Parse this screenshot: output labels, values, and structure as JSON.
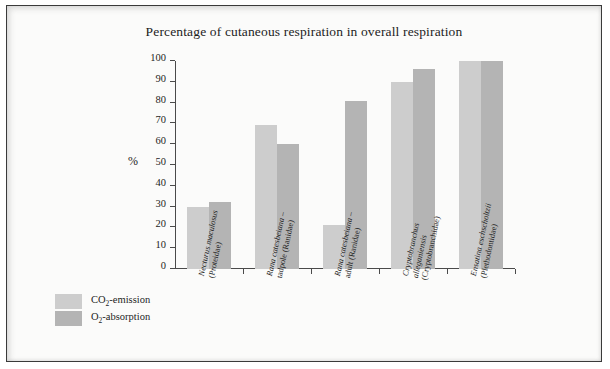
{
  "chart_data": {
    "type": "bar",
    "title": "Percentage of cutaneous respiration in overall respiration",
    "xlabel": "",
    "ylabel": "%",
    "ylim": [
      0,
      100
    ],
    "yticks": [
      0,
      10,
      20,
      30,
      40,
      50,
      60,
      70,
      80,
      90,
      100
    ],
    "grid": false,
    "legend_position": "bottom-left",
    "categories": [
      "Necturus maculosus (Proteidae)",
      "Rana catesbeiana – tadpole (Ranidae)",
      "Rana catesbeiana – adult (Ranidae)",
      "Cryptobranchus alleganiensis (Cryptobranchidae)",
      "Ensatina eschscholtzii (Plethodontidae)"
    ],
    "category_lines": [
      [
        {
          "text": "Necturus maculosus",
          "italic": true
        },
        {
          "text": "(Proteidae)",
          "italic": false
        }
      ],
      [
        {
          "text": "Rana catesbeiana",
          "italic": true,
          "suffix": " –"
        },
        {
          "text": "tadpole (Ranidae)",
          "italic": false
        }
      ],
      [
        {
          "text": "Rana catesbeiana",
          "italic": true,
          "suffix": " –"
        },
        {
          "text": "adult (Ranidae)",
          "italic": false
        }
      ],
      [
        {
          "text": "Cryptobranchus",
          "italic": true
        },
        {
          "text": "alleganiensis",
          "italic": true
        },
        {
          "text": "(Cryptobranchidae)",
          "italic": false
        }
      ],
      [
        {
          "text": "Ensatina eschscholtzii",
          "italic": true
        },
        {
          "text": "(Plethodontidae)",
          "italic": false
        }
      ]
    ],
    "series": [
      {
        "name": "CO2-emission",
        "color": "#cdcdcd",
        "values": [
          30,
          69,
          21,
          90,
          100
        ]
      },
      {
        "name": "O2-absorption",
        "color": "#b4b4b4",
        "values": [
          32,
          60,
          81,
          96,
          100
        ]
      }
    ]
  },
  "legend": {
    "items": [
      {
        "label_main": "CO",
        "label_sub": "2",
        "label_tail": "-emission",
        "color": "#cdcdcd"
      },
      {
        "label_main": "O",
        "label_sub": "2",
        "label_tail": "-absorption",
        "color": "#b4b4b4"
      }
    ]
  },
  "colors": {
    "border": "#3a3a3a",
    "background": "#fbfbfa",
    "axis": "#4a4a4a",
    "text": "#1d1d1d"
  }
}
